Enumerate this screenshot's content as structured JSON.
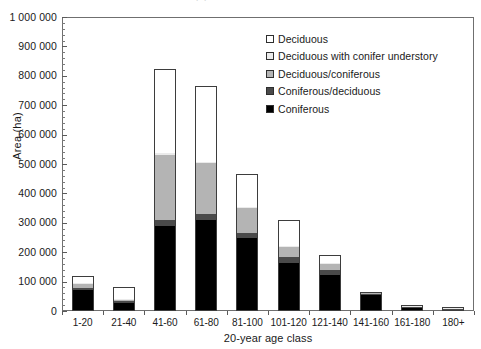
{
  "chart_data": {
    "type": "bar",
    "subtype": "stacked-vertical",
    "title": "",
    "xlabel": "20-year age class",
    "ylabel": "Area (ha)",
    "ylim": [
      0,
      1000000
    ],
    "ytick_interval": 100000,
    "yticks": [
      0,
      100000,
      200000,
      300000,
      400000,
      500000,
      600000,
      700000,
      800000,
      900000,
      1000000
    ],
    "ytick_labels": [
      "0",
      "100 000",
      "200 000",
      "300 000",
      "400 000",
      "500 000",
      "600 000",
      "700 000",
      "800 000",
      "900 000",
      "1 000 000"
    ],
    "y_minor_tick_interval": 20000,
    "grid": false,
    "legend_position": "top-center-inside",
    "categories": [
      "1-20",
      "21-40",
      "41-60",
      "61-80",
      "81-100",
      "101-120",
      "121-140",
      "141-160",
      "161-180",
      "180+"
    ],
    "series": [
      {
        "name": "Coniferous",
        "color": "#000000",
        "values": [
          72000,
          28000,
          288000,
          310000,
          248000,
          163000,
          124000,
          53000,
          11000,
          4000
        ]
      },
      {
        "name": "Coniferous/deciduous",
        "color": "#4a4a4a",
        "values": [
          8000,
          5000,
          22000,
          20000,
          18000,
          20000,
          14000,
          4000,
          1000,
          500
        ]
      },
      {
        "name": "Deciduous/coniferous",
        "color": "#b4b4b4",
        "values": [
          12000,
          5000,
          220000,
          172000,
          84000,
          35000,
          22000,
          3000,
          500,
          300
        ]
      },
      {
        "name": "Deciduous with conifer understory",
        "color": "#ebebeb",
        "values": [
          2000,
          2000,
          6000,
          5000,
          4000,
          4000,
          3000,
          1000,
          200,
          100
        ]
      },
      {
        "name": "Deciduous",
        "color": "#ffffff",
        "values": [
          24000,
          42000,
          289000,
          258000,
          113000,
          88000,
          27000,
          1000,
          300,
          100
        ]
      }
    ],
    "totals": [
      118000,
      82000,
      825000,
      765000,
      467000,
      310000,
      190000,
      62000,
      13000,
      5000
    ],
    "legend_entries": [
      "Deciduous",
      "Deciduous with conifer understory",
      "Deciduous/coniferous",
      "Coniferous/deciduous",
      "Coniferous"
    ],
    "annotations": []
  },
  "top_artifact": {
    "text": "·  ·"
  }
}
